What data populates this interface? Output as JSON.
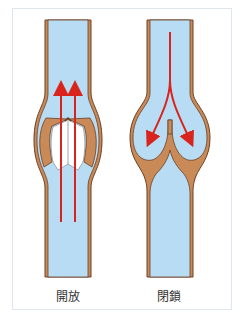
{
  "panels": [
    {
      "id": "open",
      "label": "開放",
      "flow": "upward",
      "arrow_count": 2
    },
    {
      "id": "closed",
      "label": "閉鎖",
      "flow": "downward-split",
      "arrow_count": 2
    }
  ],
  "colors": {
    "blood": "#b8dcf3",
    "wall": "#c98a58",
    "wall_outline": "#6a3f24",
    "arrow": "#d8241c",
    "valve_leaflet_open": "#ffffff",
    "frame_border": "#dfe6ee"
  }
}
